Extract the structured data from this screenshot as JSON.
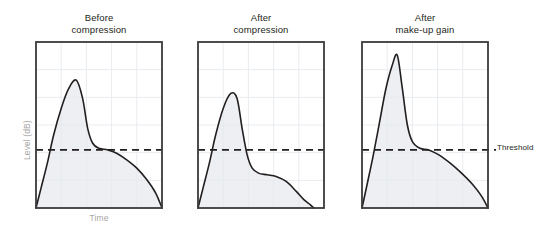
{
  "figure": {
    "background": "#ffffff",
    "axis_color": "#3a3a3a",
    "grid_color": "#e9ecef",
    "curve_color": "#231f20",
    "fill_color": "#e7eaee",
    "threshold_color": "#231f20",
    "label_color": "#a6a6a6"
  },
  "axes": {
    "y_label": "Level (dB)",
    "x_label": "Time"
  },
  "annotations": {
    "threshold_label": "Threshold"
  },
  "panels": [
    {
      "title": "Before\ncompression",
      "title_line1": "Before",
      "title_line2": "compression"
    },
    {
      "title": "After\ncompression",
      "title_line1": "After",
      "title_line2": "compression"
    },
    {
      "title": "After\nmake-up gain",
      "title_line1": "After",
      "title_line2": "make-up gain"
    }
  ],
  "chart_data": {
    "type": "line",
    "xlabel": "Time",
    "ylabel": "Level (dB)",
    "xlim": [
      0,
      1
    ],
    "ylim": [
      0,
      1
    ],
    "grid": true,
    "grid_columns": 5,
    "grid_rows": 6,
    "legend": "none",
    "annotations": [
      {
        "text": "Threshold",
        "type": "horizontal-dashed-line",
        "y": 0.35,
        "panels": [
          0,
          1,
          2
        ]
      }
    ],
    "series": [
      {
        "name": "Before compression",
        "panel": 0,
        "x": [
          0.0,
          0.04,
          0.09,
          0.14,
          0.2,
          0.26,
          0.32,
          0.37,
          0.41,
          0.45,
          0.5,
          0.57,
          0.64,
          0.72,
          0.8,
          0.88,
          0.95,
          1.0
        ],
        "y": [
          0.0,
          0.12,
          0.27,
          0.44,
          0.6,
          0.72,
          0.77,
          0.66,
          0.48,
          0.39,
          0.36,
          0.35,
          0.33,
          0.29,
          0.24,
          0.17,
          0.09,
          0.0
        ]
      },
      {
        "name": "After compression",
        "panel": 1,
        "x": [
          0.0,
          0.04,
          0.09,
          0.14,
          0.2,
          0.26,
          0.31,
          0.35,
          0.39,
          0.43,
          0.48,
          0.55,
          0.62,
          0.7,
          0.78,
          0.84,
          0.89,
          0.92
        ],
        "y": [
          0.0,
          0.12,
          0.27,
          0.44,
          0.6,
          0.69,
          0.66,
          0.48,
          0.32,
          0.24,
          0.21,
          0.2,
          0.19,
          0.16,
          0.1,
          0.05,
          0.02,
          0.0
        ]
      },
      {
        "name": "After make-up gain",
        "panel": 2,
        "x": [
          0.0,
          0.04,
          0.09,
          0.14,
          0.19,
          0.24,
          0.28,
          0.32,
          0.36,
          0.4,
          0.46,
          0.53,
          0.61,
          0.7,
          0.79,
          0.88,
          0.95,
          1.0
        ],
        "y": [
          0.0,
          0.14,
          0.32,
          0.52,
          0.72,
          0.86,
          0.92,
          0.72,
          0.5,
          0.4,
          0.36,
          0.35,
          0.32,
          0.27,
          0.21,
          0.14,
          0.07,
          0.0
        ]
      }
    ]
  }
}
